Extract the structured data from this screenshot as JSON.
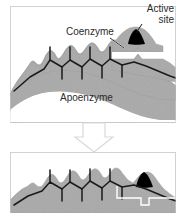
{
  "figure": {
    "background_color": "#ffffff",
    "protein_fill": "#a9a9a9",
    "protein_edge": "#8e8e8e",
    "chain_color": "#1a1a1a",
    "active_site_color": "#000000",
    "panel_border_color": "#d0d0d0",
    "arrow_color": "#d8d8d8"
  },
  "labels": {
    "active_site": "Active\nsite",
    "active_site_line1": "Active",
    "active_site_line2": "site",
    "coenzyme": "Coenzyme",
    "apoenzyme": "Apoenzyme"
  },
  "panels": [
    {
      "name": "top-panel",
      "caption": "Separate apoenzyme and coenzyme",
      "parts": [
        "apoenzyme",
        "coenzyme",
        "active site"
      ]
    },
    {
      "name": "bottom-panel",
      "caption": "Combined holoenzyme",
      "parts": [
        "holoenzyme",
        "active site"
      ]
    }
  ],
  "arrow": {
    "name": "process-arrow",
    "direction": "down",
    "style": "hollow block arrow"
  }
}
